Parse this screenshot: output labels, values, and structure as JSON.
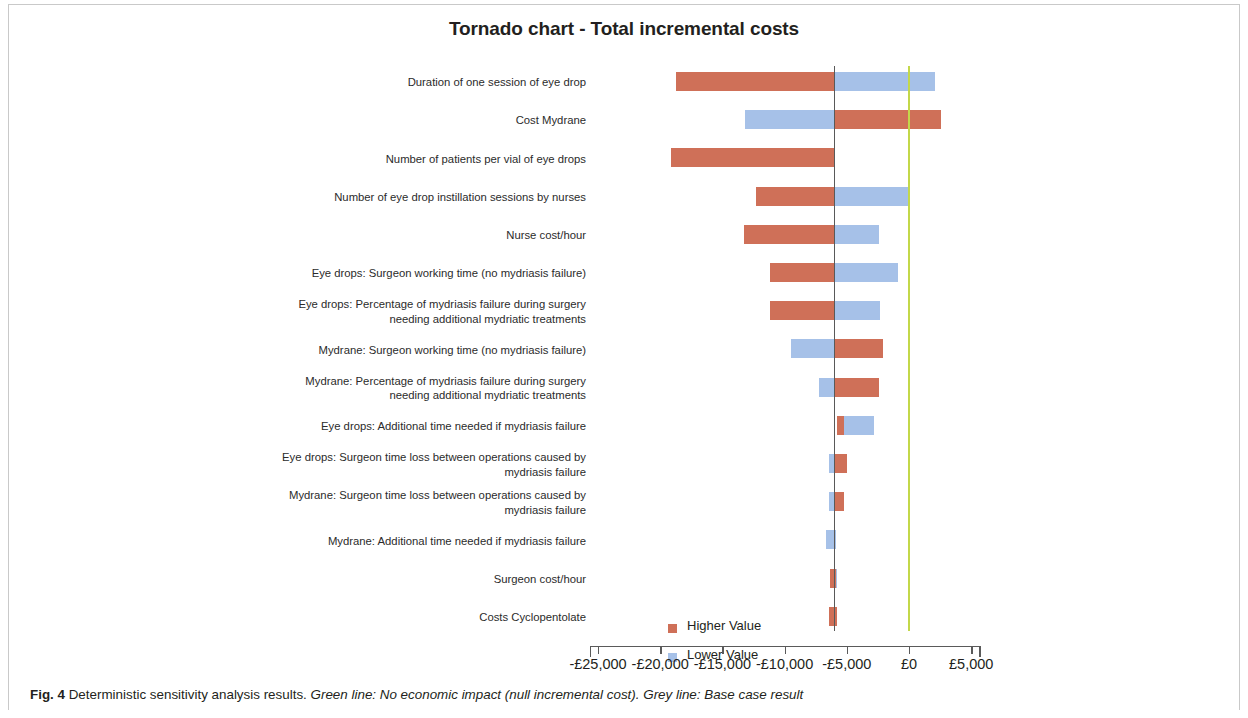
{
  "figure": {
    "caption_label": "Fig. 4",
    "caption_text": " Deterministic sensitivity analysis results. ",
    "caption_italic_1": "Green line: No economic impact (null incremental cost). Grey line: Base case result"
  },
  "colors": {
    "higher": "#cf7058",
    "lower": "#a6c1e8",
    "zero_line_green": "#c3d84a",
    "base_line_grey": "#595959",
    "text": "#231f20"
  },
  "legend": {
    "position": "inside-bottom-left",
    "items": [
      {
        "label": "Higher Value",
        "color": "#cf7058"
      },
      {
        "label": "Lower Value",
        "color": "#a6c1e8"
      }
    ]
  },
  "chart_data": {
    "type": "bar",
    "subtype": "tornado",
    "title": "Tornado chart - Total incremental costs",
    "xlabel": "",
    "ylabel": "",
    "orientation": "horizontal",
    "grid": false,
    "xlim": [
      -27500,
      6500
    ],
    "xticks": [
      -25000,
      -20000,
      -15000,
      -10000,
      -5000,
      0,
      5000
    ],
    "xtick_labels": [
      "-£25,000",
      "-£20,000",
      "-£15,000",
      "-£10,000",
      "-£5,000",
      "£0",
      "£5,000"
    ],
    "base_case_value": -6000,
    "zero_reference_value": 0,
    "currency": "GBP",
    "series": [
      {
        "name": "Higher Value",
        "color": "#cf7058"
      },
      {
        "name": "Lower Value",
        "color": "#a6c1e8"
      }
    ],
    "categories": [
      "Duration of one session of eye drop",
      "Cost Mydrane",
      "Number of patients per vial of eye drops",
      "Number of eye drop instillation sessions by nurses",
      "Nurse cost/hour",
      "Eye drops: Surgeon working time (no mydriasis failure)",
      "Eye drops: Percentage of mydriasis failure during surgery\nneeding additional mydriatic treatments",
      "Mydrane: Surgeon working time (no mydriasis failure)",
      "Mydrane: Percentage of mydriasis failure during surgery\nneeding additional mydriatic treatments",
      "Eye drops: Additional time needed if mydriasis failure",
      "Eye drops: Surgeon time loss between operations caused by\nmydriasis failure",
      "Mydrane: Surgeon time loss between operations caused by\nmydriasis failure",
      "Mydrane: Additional time needed if mydriasis failure",
      "Surgeon cost/hour",
      "Costs Cyclopentolate"
    ],
    "bars": [
      {
        "category": "Duration of one session of eye drop",
        "higher_low": -18700,
        "higher_high": -6000,
        "lower_low": -6000,
        "lower_high": 2100
      },
      {
        "category": "Cost Mydrane",
        "higher_low": -6000,
        "higher_high": 2600,
        "lower_low": -13200,
        "lower_high": -6000
      },
      {
        "category": "Number of patients per vial of eye drops",
        "higher_low": -19100,
        "higher_high": -6000,
        "lower_low": -6000,
        "lower_high": -6000
      },
      {
        "category": "Number of eye drop instillation sessions by nurses",
        "higher_low": -12300,
        "higher_high": -6000,
        "lower_low": -6000,
        "lower_high": -100
      },
      {
        "category": "Nurse cost/hour",
        "higher_low": -13300,
        "higher_high": -6000,
        "lower_low": -6000,
        "lower_high": -2400
      },
      {
        "category": "Eye drops: Surgeon working time (no mydriasis failure)",
        "higher_low": -11200,
        "higher_high": -6000,
        "lower_low": -6000,
        "lower_high": -900
      },
      {
        "category": "Eye drops: Percentage of mydriasis failure during surgery needing additional mydriatic treatments",
        "higher_low": -11200,
        "higher_high": -6000,
        "lower_low": -6000,
        "lower_high": -2300
      },
      {
        "category": "Mydrane: Surgeon working time (no mydriasis failure)",
        "higher_low": -6000,
        "higher_high": -2100,
        "lower_low": -9500,
        "lower_high": -6000
      },
      {
        "category": "Mydrane: Percentage of mydriasis failure during surgery needing additional mydriatic treatments",
        "higher_low": -6000,
        "higher_high": -2400,
        "lower_low": -7200,
        "lower_high": -6000
      },
      {
        "category": "Eye drops: Additional time needed if mydriasis failure",
        "higher_low": -5800,
        "higher_high": -5200,
        "lower_low": -5200,
        "lower_high": -2800
      },
      {
        "category": "Eye drops: Surgeon time loss between operations caused by mydriasis failure",
        "higher_low": -6000,
        "higher_high": -5000,
        "lower_low": -6400,
        "lower_high": -6000
      },
      {
        "category": "Mydrane: Surgeon time loss between operations caused by mydriasis failure",
        "higher_low": -6000,
        "higher_high": -5200,
        "lower_low": -6400,
        "lower_high": -6000
      },
      {
        "category": "Mydrane: Additional time needed if mydriasis failure",
        "higher_low": -6000,
        "higher_high": -6000,
        "lower_low": -6700,
        "lower_high": -5900
      },
      {
        "category": "Surgeon cost/hour",
        "higher_low": -6350,
        "higher_high": -5900,
        "lower_low": -5900,
        "lower_high": -5800
      },
      {
        "category": "Costs Cyclopentolate",
        "higher_low": -6400,
        "higher_high": -5800,
        "lower_low": -5800,
        "lower_high": -5800
      }
    ]
  }
}
